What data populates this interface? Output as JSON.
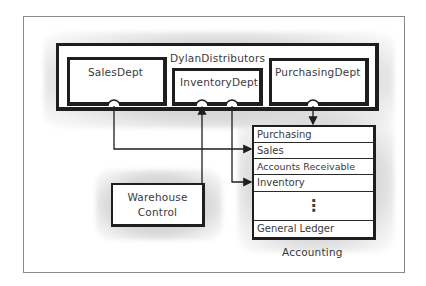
{
  "diagram": {
    "container": {
      "title": "DylanDistributors",
      "children": [
        {
          "id": "sales",
          "label": "SalesDept"
        },
        {
          "id": "inventory",
          "label": "InventoryDept"
        },
        {
          "id": "purchasing",
          "label": "PurchasingDept"
        }
      ]
    },
    "warehouse": {
      "line1": "Warehouse",
      "line2": "Control"
    },
    "accounting": {
      "caption": "Accounting",
      "rows": [
        "Purchasing",
        "Sales",
        "Accounts Receivable",
        "Inventory",
        "⋮",
        "General Ledger"
      ]
    },
    "connections": [
      {
        "from": "SalesDept",
        "to": "Accounting.Sales"
      },
      {
        "from": "Warehouse Control",
        "to": "InventoryDept"
      },
      {
        "from": "InventoryDept",
        "to": "Accounting.Inventory"
      },
      {
        "from": "PurchasingDept",
        "to": "Accounting.Purchasing"
      }
    ]
  }
}
